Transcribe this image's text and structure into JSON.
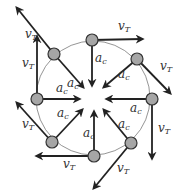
{
  "diagram": {
    "center": {
      "x": 93,
      "y": 98
    },
    "radius": 57,
    "colors": {
      "circle": "#7a7a7a",
      "arrow": "#222222",
      "ball_fill": "#a6a6a6",
      "ball_stroke": "#333333",
      "text": "#333333"
    },
    "labels": {
      "velocity_symbol": "v",
      "velocity_subscript": "T",
      "acceleration_symbol": "a",
      "acceleration_subscript": "c"
    },
    "balls": [
      {
        "name": "top-left",
        "x": 54,
        "y": 54,
        "vT_end": [
          17,
          8
        ],
        "vT_label": [
          25,
          38
        ],
        "ac_label": [
          67,
          87
        ],
        "ac_end": [
          83,
          87
        ]
      },
      {
        "name": "top",
        "x": 92,
        "y": 40,
        "vT_end": [
          142,
          39
        ],
        "vT_label": [
          118,
          30
        ],
        "ac_label": [
          95,
          62
        ],
        "ac_end": [
          92,
          85
        ]
      },
      {
        "name": "top-right",
        "x": 137,
        "y": 59,
        "vT_end": [
          170,
          93
        ],
        "vT_label": [
          160,
          70
        ],
        "ac_label": [
          118,
          78
        ],
        "ac_end": [
          104,
          87
        ]
      },
      {
        "name": "right",
        "x": 152,
        "y": 99,
        "vT_end": [
          152,
          158
        ],
        "vT_label": [
          158,
          132
        ],
        "ac_label": [
          130,
          112
        ],
        "ac_end": [
          107,
          99
        ]
      },
      {
        "name": "bottom-right",
        "x": 131,
        "y": 143,
        "vT_end": [
          94,
          188
        ],
        "vT_label": [
          117,
          172
        ],
        "ac_label": [
          118,
          128
        ],
        "ac_end": [
          104,
          110
        ]
      },
      {
        "name": "bottom",
        "x": 94,
        "y": 156,
        "vT_end": [
          37,
          156
        ],
        "vT_label": [
          63,
          168
        ],
        "ac_label": [
          83,
          137
        ],
        "ac_end": [
          94,
          112
        ]
      },
      {
        "name": "bottom-left",
        "x": 52,
        "y": 142,
        "vT_end": [
          17,
          103
        ],
        "vT_label": [
          22,
          128
        ],
        "ac_label": [
          57,
          117
        ],
        "ac_end": [
          82,
          110
        ]
      },
      {
        "name": "left",
        "x": 37,
        "y": 99,
        "vT_end": [
          37,
          37
        ],
        "vT_label": [
          22,
          67
        ],
        "ac_label": [
          56,
          92
        ],
        "ac_end": [
          79,
          99
        ]
      }
    ]
  }
}
